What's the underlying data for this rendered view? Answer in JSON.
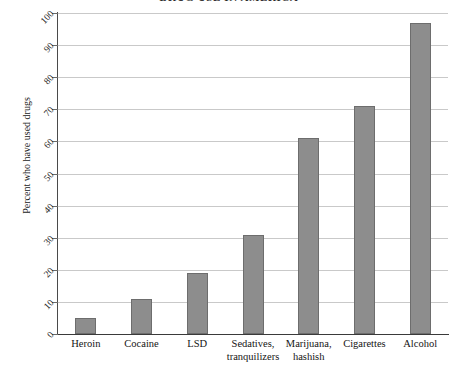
{
  "chart_data": {
    "type": "bar",
    "title": "DRUG USE IN AMERICA",
    "xlabel": "",
    "ylabel": "Percent who have used drugs",
    "ylim": [
      0,
      100
    ],
    "ytick_step": 10,
    "yticks": [
      "0",
      "10",
      "20",
      "30",
      "40",
      "50",
      "60",
      "70",
      "80",
      "90",
      "100"
    ],
    "grid": true,
    "legend": "none",
    "categories": [
      "Heroin",
      "Cocaine",
      "LSD",
      "Sedatives, tranquilizers",
      "Marijuana, hashish",
      "Cigarettes",
      "Alcohol"
    ],
    "category_lines": [
      [
        "Heroin",
        ""
      ],
      [
        "Cocaine",
        ""
      ],
      [
        "LSD",
        ""
      ],
      [
        "Sedatives,",
        "tranquilizers"
      ],
      [
        "Marijuana,",
        "hashish"
      ],
      [
        "Cigarettes",
        ""
      ],
      [
        "Alcohol",
        ""
      ]
    ],
    "values": [
      5,
      11,
      19,
      31,
      61,
      71,
      97
    ]
  },
  "style": {
    "bar_fill": "#8d8d8d",
    "bar_stroke": "#6d6d6d",
    "gridline_color": "#c9c9c9",
    "axis_color": "#3a3a3a",
    "background": "#ffffff"
  }
}
